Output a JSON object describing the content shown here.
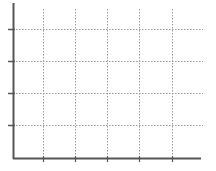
{
  "chart_data": {
    "type": "line",
    "title": "",
    "xlabel": "",
    "ylabel": "",
    "x_ticks": [
      "",
      "",
      "",
      "",
      ""
    ],
    "y_ticks": [
      "",
      "",
      "",
      ""
    ],
    "series": [],
    "grid": true,
    "grid_style": "dotted",
    "legend": null
  },
  "colors": {
    "axis": "#555555",
    "grid": "#9a9a9a",
    "background": "#ffffff"
  },
  "layout": {
    "axis_origin": [
      13,
      158
    ],
    "x_axis_end": 201,
    "y_axis_top": 3,
    "x_gridlines": [
      43,
      75,
      107,
      139,
      172
    ],
    "y_gridlines": [
      29,
      61,
      93,
      125
    ],
    "grid_top": 9,
    "grid_right": 203
  }
}
